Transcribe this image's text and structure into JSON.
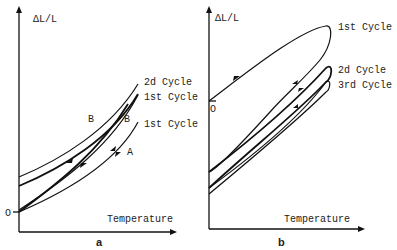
{
  "panel_a": {
    "label": "a",
    "y_axis_label": "ΔL/L",
    "x_axis_label": "Temperature",
    "origin_label": "O",
    "curve_labels": [
      "2d Cycle",
      "1st Cycle",
      "1st Cycle"
    ],
    "point_labels": [
      "B",
      "B",
      "A"
    ]
  },
  "panel_b": {
    "label": "b",
    "y_axis_label": "ΔL/L",
    "x_axis_label": "Temperature",
    "origin_label": "O",
    "curve_labels": [
      "1st Cycle",
      "2d Cycle",
      "3rd Cycle"
    ]
  }
}
